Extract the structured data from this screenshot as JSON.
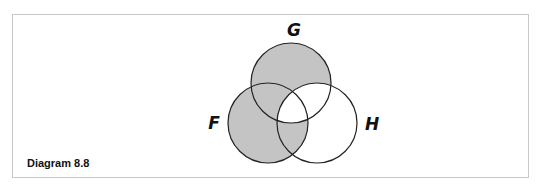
{
  "caption": "Diagram 8.8",
  "colors": {
    "shade": "#c4c4c4",
    "stroke": "#222222",
    "frame": "#c8c8c8"
  },
  "sets": [
    {
      "id": "G",
      "label": "G",
      "cx": 291,
      "cy": 83,
      "r": 40
    },
    {
      "id": "F",
      "label": "F",
      "cx": 268,
      "cy": 123,
      "r": 40
    },
    {
      "id": "H",
      "label": "H",
      "cx": 317,
      "cy": 123,
      "r": 40
    }
  ],
  "shaded_regions": [
    "G only",
    "F only",
    "F∩G not H",
    "F∩H not G"
  ],
  "unshaded_regions": [
    "H only",
    "G∩H not F",
    "F∩G∩H"
  ],
  "labels": {
    "G": {
      "text": "G",
      "x": 294,
      "y": 36
    },
    "F": {
      "text": "F",
      "x": 214,
      "y": 129
    },
    "H": {
      "text": "H",
      "x": 372,
      "y": 130
    }
  }
}
